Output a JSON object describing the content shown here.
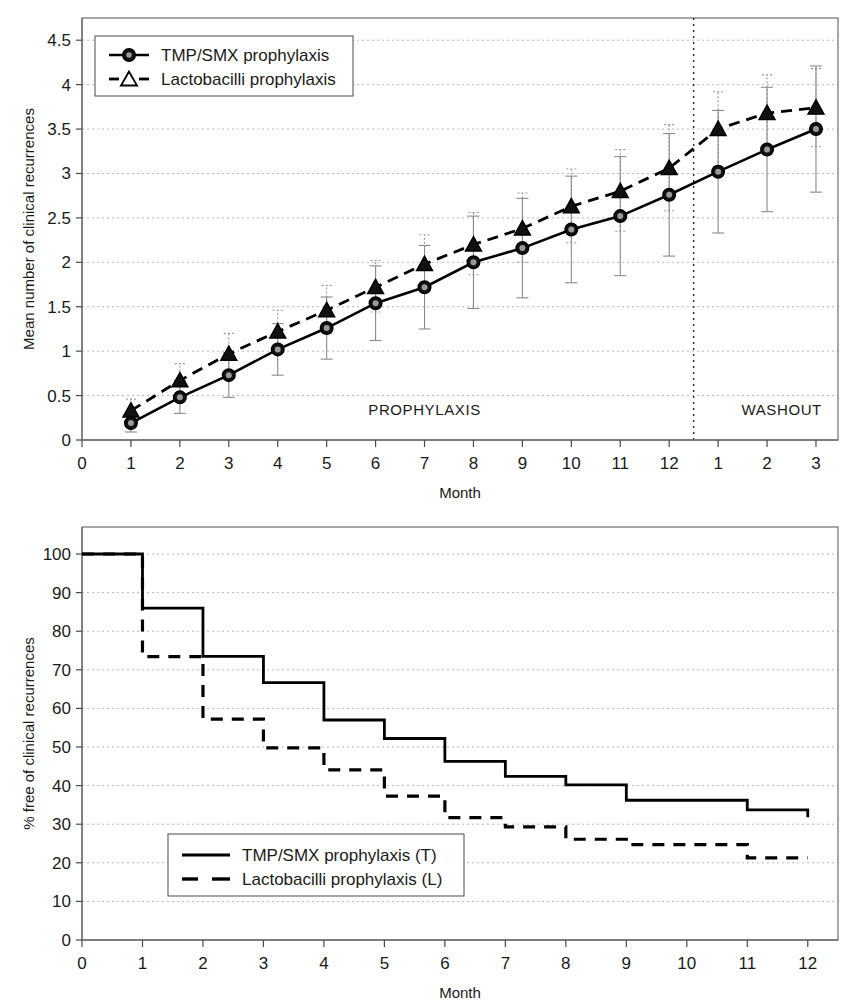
{
  "figure": {
    "panels": [
      "top",
      "bottom"
    ]
  },
  "chart_data": [
    {
      "type": "line",
      "title": "",
      "xlabel": "Month",
      "ylabel": "Mean number of clinical recurrences",
      "ylim": [
        0,
        4.75
      ],
      "yticks": [
        "0",
        "0.5",
        "1",
        "1.5",
        "2",
        "2.5",
        "3",
        "3.5",
        "4",
        "4.5"
      ],
      "ytick_values": [
        0,
        0.5,
        1,
        1.5,
        2,
        2.5,
        3,
        3.5,
        4,
        4.5
      ],
      "xticks": [
        "0",
        "1",
        "2",
        "3",
        "4",
        "5",
        "6",
        "7",
        "8",
        "9",
        "10",
        "11",
        "12",
        "1",
        "2",
        "3"
      ],
      "xtick_values": [
        0,
        1,
        2,
        3,
        4,
        5,
        6,
        7,
        8,
        9,
        10,
        11,
        12,
        13,
        14,
        15
      ],
      "grid": true,
      "legend_position": "top-left",
      "annotations": [
        {
          "text": "PROPHYLAXIS",
          "x": 7.0,
          "y": 0.28
        },
        {
          "text": "WASHOUT",
          "x": 14.3,
          "y": 0.28
        }
      ],
      "divider_x": 12.5,
      "series": [
        {
          "name": "TMP/SMX prophylaxis",
          "marker": "circle",
          "line": "solid",
          "x": [
            1,
            2,
            3,
            4,
            5,
            6,
            7,
            8,
            9,
            10,
            11,
            12,
            13,
            14,
            15
          ],
          "values": [
            0.19,
            0.48,
            0.73,
            1.02,
            1.26,
            1.54,
            1.72,
            2.0,
            2.16,
            2.37,
            2.52,
            2.76,
            3.02,
            3.27,
            3.5
          ],
          "err_low": [
            0.09,
            0.3,
            0.48,
            0.73,
            0.91,
            1.12,
            1.25,
            1.48,
            1.6,
            1.77,
            1.85,
            2.07,
            2.33,
            2.57,
            2.79
          ],
          "err_high": [
            0.29,
            0.67,
            0.98,
            1.31,
            1.61,
            1.96,
            2.19,
            2.52,
            2.72,
            2.97,
            3.19,
            3.45,
            3.71,
            3.97,
            4.21
          ]
        },
        {
          "name": "Lactobacilli prophylaxis",
          "marker": "triangle",
          "line": "dashed",
          "x": [
            1,
            2,
            3,
            4,
            5,
            6,
            7,
            8,
            9,
            10,
            11,
            12,
            13,
            14,
            15
          ],
          "values": [
            0.33,
            0.67,
            0.97,
            1.22,
            1.46,
            1.72,
            1.98,
            2.2,
            2.38,
            2.63,
            2.8,
            3.06,
            3.5,
            3.68,
            3.74
          ],
          "err_low": [
            0.22,
            0.5,
            0.77,
            1.0,
            1.2,
            1.44,
            1.67,
            1.86,
            2.0,
            2.22,
            2.35,
            2.58,
            3.08,
            3.25,
            3.3
          ],
          "err_high": [
            0.46,
            0.86,
            1.2,
            1.46,
            1.74,
            2.02,
            2.31,
            2.56,
            2.78,
            3.05,
            3.27,
            3.55,
            3.92,
            4.11,
            4.18
          ]
        }
      ]
    },
    {
      "type": "line",
      "title": "",
      "xlabel": "Month",
      "ylabel": "% free of clinical recurrences",
      "ylim": [
        0,
        107
      ],
      "yticks": [
        "0",
        "10",
        "20",
        "30",
        "40",
        "50",
        "60",
        "70",
        "80",
        "90",
        "100"
      ],
      "ytick_values": [
        0,
        10,
        20,
        30,
        40,
        50,
        60,
        70,
        80,
        90,
        100
      ],
      "xticks": [
        "0",
        "1",
        "2",
        "3",
        "4",
        "5",
        "6",
        "7",
        "8",
        "9",
        "10",
        "11",
        "12"
      ],
      "xtick_values": [
        0,
        1,
        2,
        3,
        4,
        5,
        6,
        7,
        8,
        9,
        10,
        11,
        12
      ],
      "grid": true,
      "legend_position": "bottom-left",
      "step": true,
      "series": [
        {
          "name": "TMP/SMX prophylaxis (T)",
          "line": "solid",
          "x": [
            0,
            1,
            2,
            3,
            4,
            5,
            6,
            7,
            8,
            9,
            10,
            11,
            12
          ],
          "values": [
            100,
            86,
            73.5,
            66.7,
            57,
            52.2,
            46.3,
            42.4,
            40.2,
            36.2,
            36.2,
            33.7,
            33.7
          ],
          "final_drop": 31.8
        },
        {
          "name": "Lactobacilli prophylaxis (L)",
          "line": "dashed",
          "x": [
            0,
            1,
            2,
            3,
            4,
            5,
            6,
            7,
            8,
            9,
            10,
            11,
            12
          ],
          "values": [
            100,
            73.4,
            57.2,
            49.8,
            44.1,
            37.3,
            31.7,
            29.3,
            26.1,
            24.7,
            24.7,
            21.3,
            21.3
          ]
        }
      ]
    }
  ],
  "top_chart": {
    "ylabel": "Mean number of clinical recurrences",
    "xlabel": "Month",
    "legend": {
      "items": [
        {
          "label": "TMP/SMX prophylaxis",
          "marker": "circle"
        },
        {
          "label": "Lactobacilli prophylaxis",
          "marker": "triangle"
        }
      ]
    },
    "regions": {
      "prophylaxis": "PROPHYLAXIS",
      "washout": "WASHOUT"
    }
  },
  "bottom_chart": {
    "ylabel": "% free of clinical recurrences",
    "xlabel": "Month",
    "legend": {
      "items": [
        {
          "label": "TMP/SMX prophylaxis (T)",
          "line": "solid"
        },
        {
          "label": "Lactobacilli prophylaxis (L)",
          "line": "dashed"
        }
      ]
    }
  },
  "colors": {
    "ink": "#000000",
    "frame": "#6f6f6f",
    "grid": "#b9b9b9",
    "errorbar": "#8a8a8a",
    "background": "#ffffff"
  }
}
